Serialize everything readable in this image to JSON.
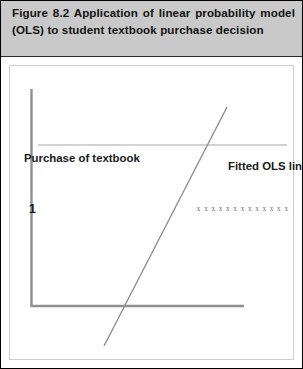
{
  "figure": {
    "caption": "Figure 8.2 Application of linear probability model (OLS) to student textbook purchase decision",
    "border_color": "#000000",
    "caption_band_color": "#c9c9c9"
  },
  "chart_data": {
    "type": "scatter",
    "title": "Figure 8.2 Application of linear probability model (OLS) to student textbook purchase decision",
    "xlabel": "Income",
    "ylabel": "Purchase of textbook",
    "ylim": [
      0,
      1
    ],
    "ytick_labels": [
      "0",
      "1"
    ],
    "xtick_labels": [],
    "grid": false,
    "legend_position": "none",
    "annotations": [
      {
        "name": "fitted-ols-line-label",
        "text": "Fitted OLS line"
      }
    ],
    "series": [
      {
        "name": "purchasers",
        "marker": "x",
        "y_value": 1,
        "count": 13,
        "color": "#6d6d6d",
        "x_start_px": 185,
        "x_end_px": 280,
        "description": "Cluster of observations at y = 1 (students who purchased) at higher incomes"
      },
      {
        "name": "non-purchasers",
        "marker": "x",
        "y_value": 0,
        "count": 12,
        "color": "#6d6d6d",
        "x_start_px": 82,
        "x_end_px": 152,
        "description": "Cluster of observations at y = 0 (students who did not purchase) at lower incomes"
      }
    ],
    "fitted_line": {
      "name": "Fitted OLS line",
      "color": "#8a8a8a",
      "x0_px": 103,
      "y0_px": 345,
      "x1_px": 226,
      "y1_px": 106,
      "description": "Upward sloping linear probability (OLS) regression line crossing both clusters"
    },
    "reference_line": {
      "name": "probability-one-line",
      "y_value": 1,
      "color": "#c4c4c4",
      "description": "Faint horizontal guide line at probability = 1"
    }
  },
  "labels": {
    "y_axis_title": "Purchase of textbook",
    "x_axis_title": "Income",
    "fitted_line": "Fitted OLS line",
    "tick_one": "1",
    "tick_zero": "0",
    "marker_glyph": "x"
  }
}
